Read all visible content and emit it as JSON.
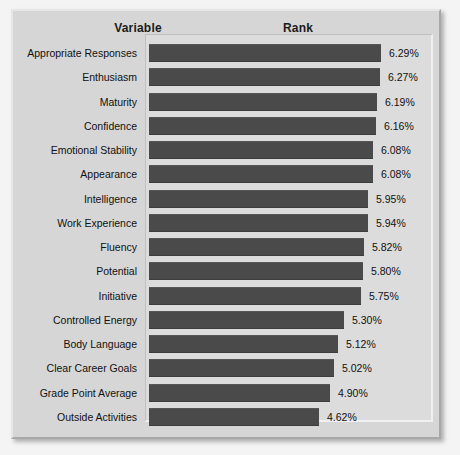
{
  "header": {
    "variable_label": "Variable",
    "rank_label": "Rank"
  },
  "colors": {
    "bar": "#4a4a4a",
    "panel_background": "#d6d6d6",
    "plot_background": "#dcdcdc",
    "text": "#111111"
  },
  "chart_data": {
    "type": "bar",
    "orientation": "horizontal",
    "title": "",
    "xlabel": "Rank",
    "ylabel": "Variable",
    "grid": false,
    "legend": null,
    "value_suffix": "%",
    "xlim": [
      0,
      6.29
    ],
    "categories": [
      "Appropriate Responses",
      "Enthusiasm",
      "Maturity",
      "Confidence",
      "Emotional Stability",
      "Appearance",
      "Intelligence",
      "Work Experience",
      "Fluency",
      "Potential",
      "Initiative",
      "Controlled Energy",
      "Body Language",
      "Clear Career Goals",
      "Grade Point Average",
      "Outside Activities"
    ],
    "values": [
      6.29,
      6.27,
      6.19,
      6.16,
      6.08,
      6.08,
      5.95,
      5.94,
      5.82,
      5.8,
      5.75,
      5.3,
      5.12,
      5.02,
      4.9,
      4.62
    ],
    "value_labels": [
      "6.29%",
      "6.27%",
      "6.19%",
      "6.16%",
      "6.08%",
      "6.08%",
      "5.95%",
      "5.94%",
      "5.82%",
      "5.80%",
      "5.75%",
      "5.30%",
      "5.12%",
      "5.02%",
      "4.90%",
      "4.62%"
    ]
  }
}
